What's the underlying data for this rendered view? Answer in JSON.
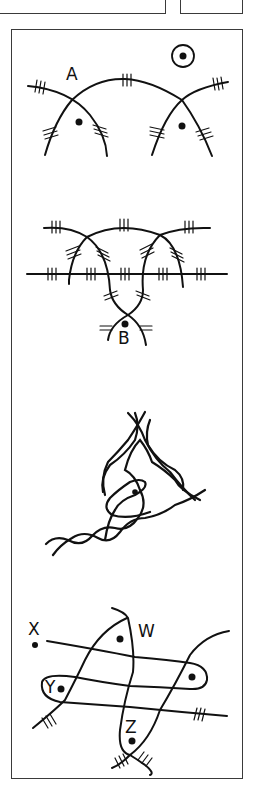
{
  "figure": {
    "type": "hand-drawn topology / knot diagrams",
    "panels": [
      {
        "id": "A",
        "labels": [
          "A"
        ],
        "description": "Two arches crossing a central arc; dots inside each arch; circled dot symbol at top right; triple hatch marks on strands"
      },
      {
        "id": "B",
        "labels": [
          "B"
        ],
        "description": "Two interlocking arches over a horizontal hatched line, strands twisting down to a crossing above label B with a dot"
      },
      {
        "id": "C",
        "labels": [],
        "description": "Three braided twisted strands forming a triangular loop with a small enclosed loop containing a dot"
      },
      {
        "id": "D",
        "labels": [
          "X",
          "W",
          "Y",
          "Z"
        ],
        "description": "Two horizontal and two vertical curves forming a grid of loops; dots near X, W, Y, Z and one at right loop"
      }
    ]
  },
  "colors": {
    "ink": "#111111",
    "frame": "#3a3a3a",
    "background": "#ffffff"
  }
}
